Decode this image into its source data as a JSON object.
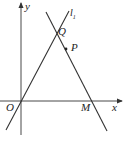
{
  "figure": {
    "axes": {
      "x_label": "x",
      "y_label": "y",
      "origin_label": "O"
    },
    "line_label": "l",
    "line_label_subscript": "1",
    "points": [
      {
        "name": "Q",
        "desc": "intersection of l1 and line PM"
      },
      {
        "name": "P",
        "desc": "point on line QM"
      },
      {
        "name": "M",
        "desc": "intersection of line with x-axis"
      }
    ],
    "colors": {
      "stroke": "#333333",
      "text": "#222222"
    }
  }
}
